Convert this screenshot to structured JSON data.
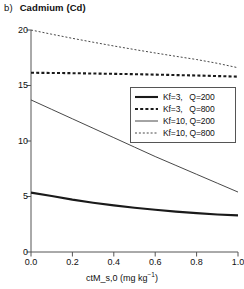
{
  "panel": {
    "label": "b)",
    "name": "Cadmium (Cd)"
  },
  "axes": {
    "xlabel_text": "ctM_s,0 (mg kg",
    "xlabel_sup": "−1",
    "xlabel_tail": ")",
    "xlabel_full": "ctM_s,0 (mg kg−1)",
    "xticks": [
      "0.0",
      "0.2",
      "0.4",
      "0.6",
      "0.8",
      "1.0"
    ],
    "yticks": [
      "0",
      "5",
      "10",
      "15",
      "20"
    ]
  },
  "legend": {
    "entries": [
      {
        "label": "Kf=3,   Q=200",
        "style": "thick-solid"
      },
      {
        "label": "Kf=3,   Q=800",
        "style": "thick-dashed"
      },
      {
        "label": "Kf=10, Q=200",
        "style": "thin-solid"
      },
      {
        "label": "Kf=10, Q=800",
        "style": "thin-dashed"
      }
    ]
  },
  "chart_data": {
    "type": "line",
    "xlabel": "ctM_s,0 (mg kg−1)",
    "ylabel": "",
    "xlim": [
      0.0,
      1.0
    ],
    "ylim": [
      0,
      20
    ],
    "xticks": [
      0.0,
      0.2,
      0.4,
      0.6,
      0.8,
      1.0
    ],
    "yticks": [
      0,
      5,
      10,
      15,
      20
    ],
    "grid": false,
    "legend_position": "center-right",
    "x": [
      0.0,
      0.1,
      0.2,
      0.3,
      0.4,
      0.5,
      0.6,
      0.7,
      0.8,
      0.9,
      1.0
    ],
    "series": [
      {
        "name": "Kf=3,   Q=200",
        "style": "thick-solid",
        "color": "#1a1a1a",
        "width": 2.1,
        "values": [
          5.35,
          5.05,
          4.72,
          4.44,
          4.2,
          3.98,
          3.8,
          3.64,
          3.5,
          3.38,
          3.3
        ]
      },
      {
        "name": "Kf=3,   Q=800",
        "style": "thick-dashed",
        "color": "#1a1a1a",
        "width": 2.1,
        "values": [
          16.15,
          16.13,
          16.11,
          16.08,
          16.05,
          16.02,
          15.98,
          15.94,
          15.9,
          15.85,
          15.8
        ]
      },
      {
        "name": "Kf=10, Q=200",
        "style": "thin-solid",
        "color": "#333333",
        "width": 0.9,
        "values": [
          13.7,
          12.85,
          12.0,
          11.15,
          10.3,
          9.45,
          8.6,
          7.8,
          7.0,
          6.2,
          5.4
        ]
      },
      {
        "name": "Kf=10, Q=800",
        "style": "thin-dashed",
        "color": "#333333",
        "width": 0.9,
        "values": [
          20.0,
          19.62,
          19.25,
          18.9,
          18.56,
          18.24,
          17.93,
          17.63,
          17.34,
          17.0,
          16.6
        ]
      }
    ]
  },
  "colors": {
    "axis": "#555555",
    "ink": "#1a1a1a",
    "background": "#ffffff"
  }
}
